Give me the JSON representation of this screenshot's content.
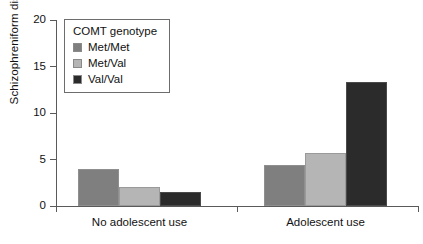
{
  "chart_data": {
    "type": "bar",
    "title": "",
    "xlabel": "",
    "ylabel": "Schizophreniform disorder",
    "ylim": [
      0,
      20
    ],
    "yticks": [
      0,
      5,
      10,
      15,
      20
    ],
    "ytick_labels": [
      "0",
      "5",
      "10",
      "15",
      "20"
    ],
    "grid": false,
    "legend_title": "COMT genotype",
    "legend_position": "upper-left-inside",
    "categories": [
      "No adolescent use",
      "Adolescent use"
    ],
    "series": [
      {
        "name": "Met/Met",
        "color": "#7f7f7f",
        "values": [
          4.0,
          4.4
        ]
      },
      {
        "name": "Met/Val",
        "color": "#b5b5b5",
        "values": [
          2.0,
          5.7
        ]
      },
      {
        "name": "Val/Val",
        "color": "#2b2b2b",
        "values": [
          1.5,
          13.3
        ]
      }
    ]
  },
  "axes": {
    "y_title": "Schizophreniform disorder",
    "y_ticks": [
      "20",
      "15",
      "10",
      "5",
      "0"
    ],
    "x_labels": [
      "No adolescent use",
      "Adolescent use"
    ]
  },
  "legend": {
    "title": "COMT genotype",
    "items": [
      {
        "label": "Met/Met",
        "color": "#7f7f7f"
      },
      {
        "label": "Met/Val",
        "color": "#b5b5b5"
      },
      {
        "label": "Val/Val",
        "color": "#2b2b2b"
      }
    ]
  }
}
